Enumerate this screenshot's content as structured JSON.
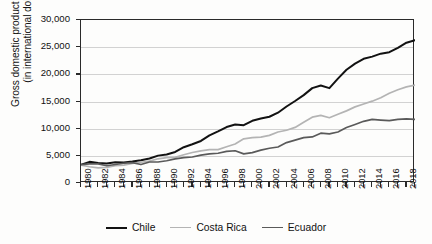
{
  "chart_data": {
    "type": "line",
    "title": "",
    "xlabel": "",
    "ylabel": "Gross domestic product per capita (in international dollars)",
    "ylabel_line1": "Gross domestic product per capita",
    "ylabel_line2": "(in international dollars)",
    "ylim": [
      0,
      30000
    ],
    "xlim": [
      1980,
      2019
    ],
    "grid": true,
    "legend_position": "bottom",
    "ytick_labels": [
      "30,000",
      "25,000",
      "20,000",
      "15,000",
      "10,000",
      "5,000",
      "0"
    ],
    "ytick_values": [
      30000,
      25000,
      20000,
      15000,
      10000,
      5000,
      0
    ],
    "xtick_labels": [
      "1980",
      "1982",
      "1984",
      "1986",
      "1988",
      "1990",
      "1992",
      "1994",
      "1996",
      "1998",
      "2000",
      "2002",
      "2004",
      "2006",
      "2008",
      "2010",
      "2012",
      "2014",
      "2016",
      "2018"
    ],
    "xtick_values": [
      1980,
      1982,
      1984,
      1986,
      1988,
      1990,
      1992,
      1994,
      1996,
      1998,
      2000,
      2002,
      2004,
      2006,
      2008,
      2010,
      2012,
      2014,
      2016,
      2018
    ],
    "x": [
      1980,
      1981,
      1982,
      1983,
      1984,
      1985,
      1986,
      1987,
      1988,
      1989,
      1990,
      1991,
      1992,
      1993,
      1994,
      1995,
      1996,
      1997,
      1998,
      1999,
      2000,
      2001,
      2002,
      2003,
      2004,
      2005,
      2006,
      2007,
      2008,
      2009,
      2010,
      2011,
      2012,
      2013,
      2014,
      2015,
      2016,
      2017,
      2018,
      2019
    ],
    "series": [
      {
        "name": "Chile",
        "color": "#121212",
        "width": 2.0,
        "values": [
          3350,
          3700,
          3600,
          3550,
          3700,
          3800,
          4000,
          4250,
          4600,
          5050,
          5300,
          5650,
          6250,
          6700,
          7100,
          7800,
          8350,
          8950,
          9300,
          9250,
          9700,
          10000,
          10250,
          10650,
          11400,
          12100,
          12750,
          13450,
          13900,
          13600,
          14700,
          15600,
          16300,
          16800,
          17300,
          17700,
          18000,
          18600,
          19200,
          19400
        ],
        "values_raw_note": "indexed same as x"
      },
      {
        "name": "Costa Rica",
        "color": "#b4b4b4",
        "width": 1.7,
        "values": [
          3300,
          3150,
          3050,
          3100,
          3250,
          3300,
          3450,
          3550,
          3650,
          3850,
          3950,
          3980,
          4200,
          4400,
          4550,
          4650,
          4650,
          4900,
          5150,
          5600,
          5700,
          5750,
          5900,
          6200,
          6350,
          6600,
          7050,
          7500,
          7650,
          7450,
          7750,
          8050,
          8400,
          8650,
          8900,
          9200,
          9600,
          9900,
          10150,
          10300
        ]
      },
      {
        "name": "Ecuador",
        "color": "#5a5a5a",
        "width": 1.7,
        "values": [
          3400,
          3450,
          3450,
          3300,
          3400,
          3500,
          3550,
          3400,
          3600,
          3600,
          3700,
          3850,
          3950,
          4000,
          4150,
          4250,
          4300,
          4450,
          4500,
          4250,
          4350,
          4550,
          4700,
          4800,
          5150,
          5350,
          5550,
          5600,
          5900,
          5850,
          6000,
          6350,
          6600,
          6850,
          7000,
          6950,
          6900,
          7000,
          7050,
          7000
        ]
      }
    ],
    "series_display": [
      {
        "name": "Chile",
        "color": "#121212",
        "width": 2.0,
        "points": [
          [
            1980,
            3350
          ],
          [
            1981,
            3720
          ],
          [
            1982,
            3580
          ],
          [
            1983,
            3520
          ],
          [
            1984,
            3680
          ],
          [
            1985,
            3780
          ],
          [
            1986,
            3980
          ],
          [
            1987,
            4180
          ],
          [
            1988,
            4450
          ],
          [
            1989,
            4900
          ],
          [
            1990,
            5100
          ],
          [
            1991,
            5450
          ],
          [
            1992,
            6050
          ],
          [
            1993,
            6450
          ],
          [
            1994,
            6800
          ],
          [
            1995,
            7500
          ],
          [
            1996,
            8050
          ],
          [
            1997,
            8700
          ],
          [
            1998,
            9050
          ],
          [
            1999,
            8950
          ],
          [
            2000,
            9500
          ],
          [
            2001,
            9900
          ],
          [
            2002,
            10100
          ],
          [
            2003,
            10500
          ],
          [
            2004,
            11300
          ],
          [
            2005,
            12100
          ],
          [
            2006,
            12900
          ],
          [
            2007,
            13700
          ],
          [
            2008,
            14150
          ],
          [
            2009,
            13850
          ],
          [
            2010,
            15000
          ],
          [
            2011,
            16100
          ],
          [
            2012,
            17000
          ],
          [
            2013,
            17600
          ],
          [
            2014,
            17900
          ],
          [
            2015,
            18300
          ],
          [
            2016,
            18600
          ],
          [
            2017,
            19200
          ],
          [
            2018,
            20100
          ],
          [
            2019,
            20400
          ]
        ]
      }
    ],
    "annotations": [],
    "notes": [
      "Chile rises from about 3,350 in 1980 to about 26,300 in 2019 with a dip in 2009.",
      "Costa Rica rises from about 3,300 in 1980 to about 18,000 in 2019 with a dip in 2009.",
      "Ecuador rises from about 3,400 in 1980 to about 11,700 in 2019 with dips around 1999 and a plateau after 2014."
    ]
  },
  "chart_render": {
    "chile": [
      [
        1980,
        3350
      ],
      [
        1981,
        3750
      ],
      [
        1982,
        3600
      ],
      [
        1983,
        3520
      ],
      [
        1984,
        3700
      ],
      [
        1985,
        3650
      ],
      [
        1986,
        3800
      ],
      [
        1987,
        3980
      ],
      [
        1988,
        4200
      ],
      [
        1989,
        4600
      ],
      [
        1990,
        4750
      ],
      [
        1991,
        5100
      ],
      [
        1992,
        5750
      ],
      [
        1993,
        6150
      ],
      [
        1994,
        6600
      ],
      [
        1995,
        7350
      ],
      [
        1996,
        7900
      ],
      [
        1997,
        8500
      ],
      [
        1998,
        8850
      ],
      [
        1999,
        8750
      ],
      [
        2000,
        9350
      ],
      [
        2001,
        9650
      ],
      [
        2002,
        9900
      ],
      [
        2003,
        10450
      ],
      [
        2004,
        11300
      ],
      [
        2005,
        12050
      ],
      [
        2006,
        12850
      ],
      [
        2007,
        13800
      ],
      [
        2008,
        14150
      ],
      [
        2009,
        13800
      ],
      [
        2010,
        15100
      ],
      [
        2011,
        16300
      ],
      [
        2012,
        17150
      ],
      [
        2013,
        17800
      ],
      [
        2014,
        18100
      ],
      [
        2015,
        18500
      ],
      [
        2016,
        18700
      ],
      [
        2017,
        19300
      ],
      [
        2018,
        20000
      ],
      [
        2019,
        20350
      ]
    ],
    "legend": [
      {
        "label": "Chile",
        "color": "#121212",
        "width": 2.0
      },
      {
        "label": "Costa Rica",
        "color": "#b4b4b4",
        "width": 1.8
      },
      {
        "label": "Ecuador",
        "color": "#5a5a5a",
        "width": 1.8
      }
    ]
  },
  "legend": {
    "items": [
      {
        "label": "Chile",
        "color": "#121212",
        "width": 2.0
      },
      {
        "label": "Costa Rica",
        "color": "#b4b4b4",
        "width": 1.8
      },
      {
        "label": "Ecuador",
        "color": "#5a5a5a",
        "width": 1.8
      }
    ]
  }
}
